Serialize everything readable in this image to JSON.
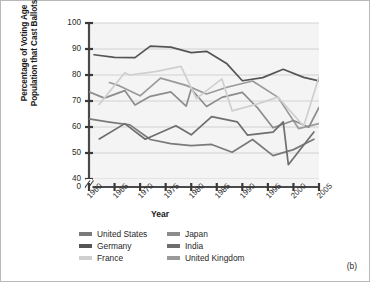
{
  "panel_label": "(b)",
  "axis": {
    "ylabel_line1": "Percentage of Voting Age",
    "ylabel_line2": "Population that Cast Ballots",
    "xlabel": "Year",
    "yticks": [
      "100",
      "90",
      "80",
      "70",
      "60",
      "50",
      "40",
      "0"
    ],
    "xticks": [
      "1960",
      "1965",
      "1970",
      "1975",
      "1980",
      "1985",
      "1990",
      "1995",
      "2000",
      "2005"
    ]
  },
  "legend": {
    "items": [
      {
        "label": "United States",
        "color": "#7a7a7a"
      },
      {
        "label": "Japan",
        "color": "#8c8c8c"
      },
      {
        "label": "Germany",
        "color": "#555555"
      },
      {
        "label": "India",
        "color": "#6e6e6e"
      },
      {
        "label": "France",
        "color": "#cfcfcf"
      },
      {
        "label": "United Kingdom",
        "color": "#9a9a9a"
      }
    ]
  },
  "chart_data": {
    "type": "line",
    "title": "",
    "xlabel": "Year",
    "ylabel": "Percentage of Voting Age Population that Cast Ballots",
    "xlim": [
      1960,
      2005
    ],
    "ylim": [
      40,
      100
    ],
    "y_axis_break": true,
    "y_axis_break_between": [
      0,
      40
    ],
    "grid": true,
    "grid_axis": "y",
    "legend_position": "below",
    "x": [
      1960,
      1963,
      1966,
      1969,
      1972,
      1975,
      1978,
      1981,
      1984,
      1987,
      1990,
      1993,
      1996,
      1999,
      2002,
      2005
    ],
    "series": [
      {
        "name": "Germany",
        "color": "#555555",
        "x": [
          1961,
          1965,
          1969,
          1972,
          1976,
          1980,
          1983,
          1987,
          1990,
          1994,
          1998,
          2002,
          2005
        ],
        "values": [
          87.8,
          86.8,
          86.7,
          91.1,
          90.7,
          88.6,
          89.1,
          84.3,
          77.8,
          79.0,
          82.2,
          79.1,
          77.7
        ]
      },
      {
        "name": "United Kingdom",
        "color": "#9a9a9a",
        "x": [
          1964,
          1966,
          1970,
          1974,
          1979,
          1983,
          1987,
          1992,
          1997,
          2001,
          2005
        ],
        "values": [
          77.1,
          75.8,
          72.0,
          78.8,
          76.0,
          72.7,
          75.3,
          77.7,
          71.4,
          59.4,
          61.3
        ]
      },
      {
        "name": "Japan",
        "color": "#8c8c8c",
        "x": [
          1960,
          1963,
          1967,
          1969,
          1972,
          1976,
          1979,
          1980,
          1983,
          1986,
          1990,
          1993,
          1996,
          2000,
          2003,
          2005
        ],
        "values": [
          73.5,
          71.1,
          74.0,
          68.5,
          71.8,
          73.5,
          68.0,
          74.6,
          67.9,
          71.4,
          73.3,
          67.3,
          59.7,
          62.5,
          59.9,
          67.5
        ]
      },
      {
        "name": "France",
        "color": "#cfcfcf",
        "x": [
          1962,
          1967,
          1968,
          1973,
          1978,
          1981,
          1986,
          1988,
          1993,
          1997,
          2002,
          2005
        ],
        "values": [
          68.7,
          80.9,
          80.0,
          81.3,
          83.3,
          70.9,
          78.5,
          66.2,
          68.9,
          71.5,
          60.3,
          79.3
        ]
      },
      {
        "name": "United States",
        "color": "#7a7a7a",
        "x": [
          1960,
          1964,
          1968,
          1972,
          1976,
          1980,
          1984,
          1988,
          1992,
          1996,
          2000,
          2004
        ],
        "values": [
          63.1,
          61.9,
          60.8,
          55.2,
          53.6,
          52.8,
          53.3,
          50.3,
          55.2,
          49.0,
          51.3,
          55.3
        ]
      },
      {
        "name": "India",
        "color": "#6e6e6e",
        "x": [
          1962,
          1967,
          1971,
          1977,
          1980,
          1984,
          1989,
          1991,
          1996,
          1998,
          1999,
          2004
        ],
        "values": [
          55.4,
          61.3,
          55.3,
          60.5,
          57.0,
          64.0,
          62.0,
          56.9,
          58.0,
          62.0,
          45.5,
          58.1
        ]
      }
    ]
  }
}
